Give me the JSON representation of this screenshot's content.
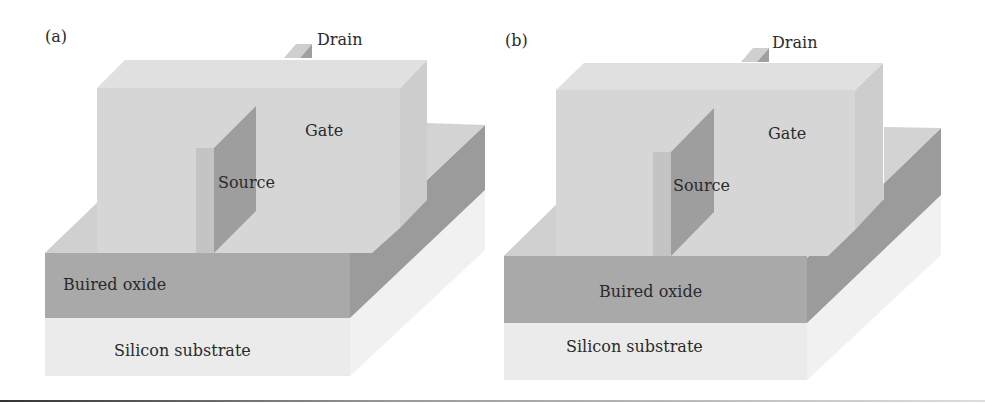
{
  "figure": {
    "panels": [
      {
        "id": "a",
        "panel_label": "(a)",
        "labels": {
          "drain": "Drain",
          "gate": "Gate",
          "source": "Source",
          "buried_oxide": "Buired oxide",
          "substrate": "Silicon substrate"
        }
      },
      {
        "id": "b",
        "panel_label": "(b)",
        "labels": {
          "drain": "Drain",
          "gate": "Gate",
          "source": "Source",
          "buried_oxide": "Buired oxide",
          "substrate": "Silicon substrate"
        }
      }
    ],
    "colors": {
      "gate_front": "#d6d6d6",
      "gate_top": "#e2e2e2",
      "gate_side": "#cfcfcf",
      "oxide_front": "#a9a9a9",
      "oxide_side": "#9a9a9a",
      "oxide_top": "#d2d2d2",
      "substrate_front": "#ececec",
      "substrate_side": "#f2f2f2",
      "source_front": "#c2c2c2",
      "source_side": "#9c9c9c"
    }
  }
}
